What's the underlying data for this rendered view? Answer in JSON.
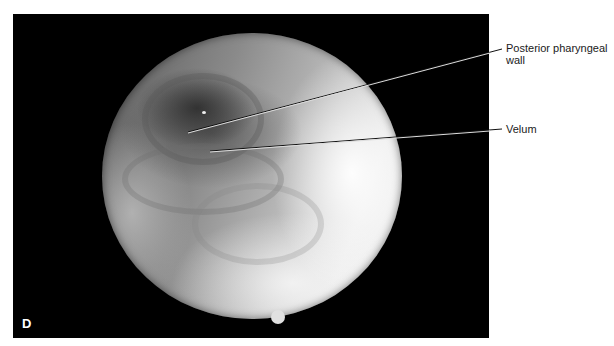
{
  "figure": {
    "panel_letter": "D",
    "image_description": "Endoscopic view of velopharynx (circular scope image on black background)",
    "labels": [
      {
        "id": "posterior-pharyngeal-wall",
        "line1": "Posterior pharyngeal",
        "line2": "wall"
      },
      {
        "id": "velum",
        "line1": "Velum",
        "line2": ""
      }
    ],
    "colors": {
      "background": "#ffffff",
      "panel": "#000000",
      "label_text": "#1a1a1a"
    }
  }
}
